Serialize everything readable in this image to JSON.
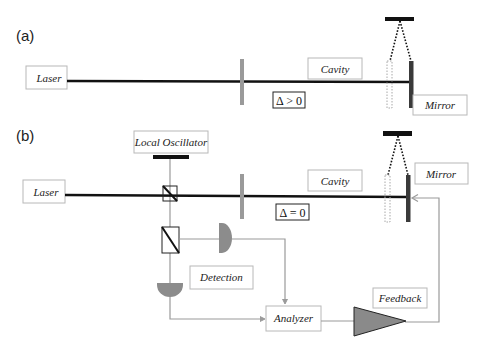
{
  "panels": {
    "a": {
      "label": "(a)",
      "laser": "Laser",
      "cavity": "Cavity",
      "detuning": "Δ > 0",
      "mirror": "Mirror"
    },
    "b": {
      "label": "(b)",
      "local_oscillator": "Local Oscillator",
      "laser": "Laser",
      "cavity": "Cavity",
      "detuning": "Δ = 0",
      "mirror": "Mirror",
      "detection": "Detection",
      "analyzer": "Analyzer",
      "feedback": "Feedback"
    }
  },
  "colors": {
    "beam": "#111111",
    "input_mirror": "#9a9a9a",
    "end_mirror": "#3a3a3a",
    "signal_line": "#9a9a9a",
    "detector": "#8c8c8c",
    "amplifier": "#8a8a8a",
    "box_border": "#b8b8b8"
  }
}
